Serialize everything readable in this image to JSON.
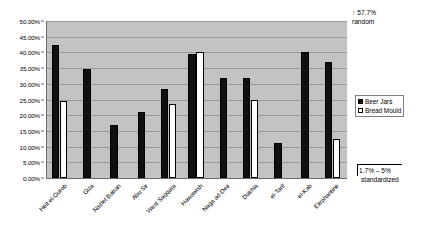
{
  "chart_data": {
    "type": "bar",
    "title": "",
    "xlabel": "",
    "ylabel": "",
    "ylim": [
      0,
      50
    ],
    "grid": true,
    "legend_position": "right",
    "categories": [
      "Heit el-Gurob",
      "Giza",
      "Nazlet Batran",
      "Abu Sir",
      "West Saqqara",
      "Hawawish",
      "Naga ad-Deir",
      "Dakhla",
      "el-Tarif",
      "el-Kab",
      "Elephantine"
    ],
    "ytick_labels": [
      "0.00%",
      "5.00%",
      "10.00%",
      "15.00%",
      "20.00%",
      "25.00%",
      "30.00%",
      "35.00%",
      "40.00%",
      "45.00%",
      "50.00%"
    ],
    "ytick_values": [
      0,
      5,
      10,
      15,
      20,
      25,
      30,
      35,
      40,
      45,
      50
    ],
    "series": [
      {
        "name": "Beer Jars",
        "color": "#101010",
        "values": [
          42.5,
          34.8,
          17.0,
          21.0,
          28.5,
          39.6,
          32.0,
          31.7,
          11.0,
          40.0,
          37.0
        ]
      },
      {
        "name": "Bread Mould",
        "color": "#ffffff",
        "values": [
          24.5,
          null,
          null,
          null,
          23.5,
          40.0,
          null,
          25.0,
          null,
          null,
          12.5
        ]
      }
    ],
    "annotations": [
      {
        "id": "random-note",
        "arrow": "↑",
        "line1": "57.7%",
        "line2": "random"
      },
      {
        "id": "standardized-note",
        "line1": "1.7% – 5%",
        "line2": "standardized"
      }
    ]
  },
  "legend": {
    "items": [
      {
        "label": "Beer Jars",
        "swatch": "beer"
      },
      {
        "label": "Bread Mould",
        "swatch": "bread"
      }
    ]
  }
}
